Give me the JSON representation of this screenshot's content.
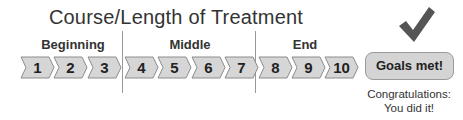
{
  "title": "Course/Length of Treatment",
  "phases": [
    {
      "label": "Beginning",
      "steps": [
        "1",
        "2",
        "3"
      ]
    },
    {
      "label": "Middle",
      "steps": [
        "4",
        "5",
        "6",
        "7"
      ]
    },
    {
      "label": "End",
      "steps": [
        "8",
        "9",
        "10"
      ]
    }
  ],
  "goal": {
    "label": "Goals met!",
    "icon": "checkmark-icon",
    "caption_line1": "Congratulations:",
    "caption_line2": "You did it!"
  },
  "colors": {
    "chevron_fill": "#d6d6d6",
    "chevron_stroke": "#8c8c8c",
    "goal_fill": "#d4d4d4",
    "checkmark": "#555555",
    "divider": "#999999"
  }
}
